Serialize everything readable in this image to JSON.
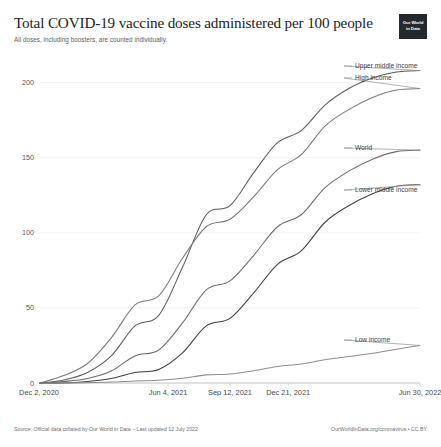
{
  "header": {
    "title": "Total COVID-19 vaccine doses administered per 100 people",
    "subtitle": "All doses, including boosters, are counted individually.",
    "logo_line1": "Our World",
    "logo_line2": "in Data"
  },
  "footer": {
    "source": "Source: Official data collated by Our World in Data – Last updated 12 July 2022",
    "license": "OurWorldInData.org/coronavirus • CC BY"
  },
  "chart_data": {
    "type": "line",
    "title": "Total COVID-19 vaccine doses administered per 100 people",
    "subtitle": "All doses, including boosters, are counted individually.",
    "xlabel": "",
    "ylabel": "",
    "ylim": [
      0,
      215
    ],
    "yticks": [
      0,
      50,
      100,
      150,
      200
    ],
    "ytick_labels": [
      "0",
      "50",
      "100",
      "150",
      "200"
    ],
    "grid": true,
    "legend_position": "right-inline",
    "x": [
      "Dec 2, 2020",
      "Jan 15, 2021",
      "Feb 26, 2021",
      "Apr 10, 2021",
      "May 22, 2021",
      "Jun 4, 2021",
      "Jul 20, 2021",
      "Sep 1, 2021",
      "Sep 12, 2021",
      "Oct 15, 2021",
      "Nov 27, 2021",
      "Dec 21, 2021",
      "Feb 10, 2022",
      "Mar 25, 2022",
      "May 8, 2022",
      "Jun 30, 2022",
      "Jul 12, 2022"
    ],
    "xticks": [
      "Dec 2, 2020",
      "Jun 4, 2021",
      "Sep 12, 2021",
      "Dec 21, 2021",
      "Jun 30, 2022"
    ],
    "xtick_positions": [
      0,
      0.337,
      0.5,
      0.653,
      1.0
    ],
    "series": [
      {
        "name": "Upper middle income",
        "color": "#5c5c5c",
        "label_y": 66,
        "values": [
          0,
          2,
          7,
          18,
          38,
          45,
          77,
          112,
          118,
          140,
          160,
          168,
          185,
          196,
          203,
          207,
          208
        ]
      },
      {
        "name": "High income",
        "color": "#7a7a7a",
        "label_y": 78,
        "values": [
          0,
          5,
          13,
          30,
          52,
          58,
          83,
          104,
          109,
          124,
          142,
          152,
          171,
          182,
          190,
          195,
          196
        ]
      },
      {
        "name": "World",
        "color": "#6b6b6b",
        "label_y": 148,
        "values": [
          0,
          1,
          3,
          8,
          18,
          22,
          40,
          62,
          68,
          85,
          104,
          112,
          130,
          141,
          149,
          154,
          155
        ]
      },
      {
        "name": "Lower middle income",
        "color": "#3f3f3f",
        "label_y": 190,
        "values": [
          0,
          0,
          1,
          3,
          7,
          9,
          20,
          38,
          43,
          60,
          79,
          88,
          107,
          118,
          126,
          131,
          132
        ]
      },
      {
        "name": "Low income",
        "color": "#8e8e8e",
        "label_y": 340,
        "values": [
          0,
          0,
          0.2,
          0.6,
          1.4,
          1.8,
          3.2,
          5.4,
          6.0,
          8.2,
          11.0,
          12.6,
          15.5,
          17.6,
          19.8,
          22.5,
          25.0
        ]
      }
    ]
  }
}
